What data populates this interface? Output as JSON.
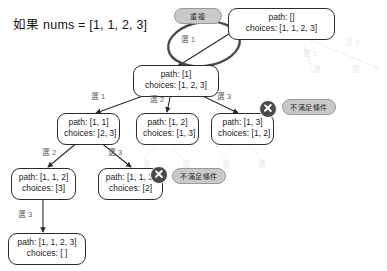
{
  "diagram": {
    "title": "如果  nums = [1, 1, 2, 3]",
    "type": "backtracking-decision-tree",
    "nodes": [
      {
        "id": "root",
        "path_line": "path: []",
        "choices_line": "choices: [1, 1, 2, 3]",
        "x": 228,
        "y": 8,
        "w": 107
      },
      {
        "id": "n1",
        "path_line": "path: [1]",
        "choices_line": "choices: [1, 2, 3]",
        "x": 133,
        "y": 65,
        "w": 86
      },
      {
        "id": "n11",
        "path_line": "path: [1, 1]",
        "choices_line": "choices: [2, 3]",
        "x": 57,
        "y": 113,
        "w": 63
      },
      {
        "id": "n12",
        "path_line": "path: [1, 2]",
        "choices_line": "choices: [1, 3]",
        "x": 136,
        "y": 113,
        "w": 63
      },
      {
        "id": "n13",
        "path_line": "path: [1, 3]",
        "choices_line": "choices: [1, 2]",
        "x": 211,
        "y": 113,
        "w": 63
      },
      {
        "id": "n112",
        "path_line": "path: [1, 1, 2]",
        "choices_line": "choices: [3]",
        "x": 11,
        "y": 168,
        "w": 65
      },
      {
        "id": "n113",
        "path_line": "path: [1, 1, 3]",
        "choices_line": "choices: [2]",
        "x": 98,
        "y": 168,
        "w": 65
      },
      {
        "id": "n1123",
        "path_line": "path: [1, 1, 2, 3]",
        "choices_line": "choices: [ ]",
        "x": 8,
        "y": 233,
        "w": 78
      }
    ],
    "edge_labels": [
      {
        "id": "e-root-n1",
        "text": "選 1",
        "x": 181,
        "y": 33
      },
      {
        "id": "e-n1-n11",
        "text": "選 1",
        "x": 91,
        "y": 90
      },
      {
        "id": "e-n1-n12",
        "text": "選 2",
        "x": 150,
        "y": 93
      },
      {
        "id": "e-n1-n13",
        "text": "選 3",
        "x": 217,
        "y": 90
      },
      {
        "id": "e-n11-n112",
        "text": "選 2",
        "x": 42,
        "y": 146
      },
      {
        "id": "e-n11-n113",
        "text": "選 3",
        "x": 108,
        "y": 146
      },
      {
        "id": "e-n112-n1123",
        "text": "選 3",
        "x": 18,
        "y": 208
      }
    ],
    "ghost_labels": [
      {
        "id": "ghost-1",
        "text": "選 2",
        "x": 303,
        "y": 47
      },
      {
        "id": "ghost-2",
        "text": "選 3",
        "x": 345,
        "y": 36
      },
      {
        "id": "ghost-3",
        "text": "選",
        "x": 313,
        "y": 63
      },
      {
        "id": "ghost-4",
        "text": "選",
        "x": 352,
        "y": 63
      },
      {
        "id": "ghost-5",
        "text": "選",
        "x": 143,
        "y": 158
      },
      {
        "id": "ghost-6",
        "text": "選",
        "x": 182,
        "y": 158
      },
      {
        "id": "ghost-7",
        "text": "選",
        "x": 222,
        "y": 158
      },
      {
        "id": "ghost-8",
        "text": "選",
        "x": 258,
        "y": 158
      }
    ],
    "badges": [
      {
        "id": "duplicate-badge",
        "text": "重複",
        "x": 174,
        "y": 8,
        "w": 48
      },
      {
        "id": "reject-badge-1",
        "text": "不滿足條件",
        "x": 282,
        "y": 99,
        "w": 54
      },
      {
        "id": "reject-badge-2",
        "text": "不滿足條件",
        "x": 172,
        "y": 168,
        "w": 54
      }
    ],
    "x_marks": [
      {
        "id": "x-mark-n13",
        "x": 259,
        "y": 100
      },
      {
        "id": "x-mark-n113",
        "x": 150,
        "y": 166
      }
    ],
    "highlight_ellipse": {
      "id": "duplicate-highlight-ellipse",
      "cx": 204,
      "cy": 44,
      "rx": 36,
      "ry": 22,
      "rotate": -8,
      "color": "#4a4a4a"
    }
  }
}
